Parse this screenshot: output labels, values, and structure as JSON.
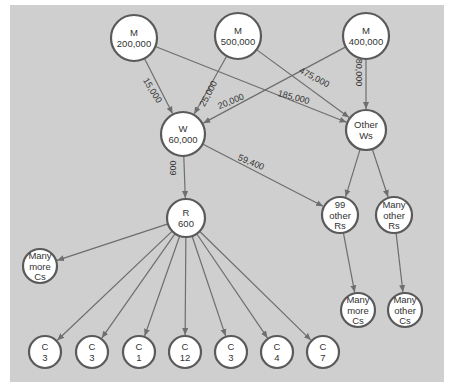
{
  "diagram": {
    "background_color": "#cfcfcf",
    "nodes": [
      {
        "id": "m1",
        "lines": [
          "M",
          "200,000"
        ],
        "x": 134,
        "y": 38,
        "r": 23
      },
      {
        "id": "m2",
        "lines": [
          "M",
          "500,000"
        ],
        "x": 238,
        "y": 36,
        "r": 23
      },
      {
        "id": "m3",
        "lines": [
          "M",
          "400,000"
        ],
        "x": 366,
        "y": 36,
        "r": 23
      },
      {
        "id": "w",
        "lines": [
          "W",
          "60,000"
        ],
        "x": 183,
        "y": 134,
        "r": 22
      },
      {
        "id": "ows",
        "lines": [
          "Other",
          "Ws"
        ],
        "x": 366,
        "y": 130,
        "r": 20
      },
      {
        "id": "r",
        "lines": [
          "R",
          "600"
        ],
        "x": 186,
        "y": 218,
        "r": 19
      },
      {
        "id": "r99",
        "lines": [
          "99",
          "other",
          "Rs"
        ],
        "x": 340,
        "y": 215,
        "r": 18
      },
      {
        "id": "mors",
        "lines": [
          "Many",
          "other",
          "Rs"
        ],
        "x": 394,
        "y": 215,
        "r": 18
      },
      {
        "id": "mcl",
        "lines": [
          "Many",
          "more",
          "Cs"
        ],
        "x": 40,
        "y": 266,
        "r": 17
      },
      {
        "id": "c1",
        "lines": [
          "C",
          "3"
        ],
        "x": 45,
        "y": 352,
        "r": 16
      },
      {
        "id": "c2",
        "lines": [
          "C",
          "3"
        ],
        "x": 92,
        "y": 352,
        "r": 16
      },
      {
        "id": "c3",
        "lines": [
          "C",
          "1"
        ],
        "x": 139,
        "y": 352,
        "r": 16
      },
      {
        "id": "c4",
        "lines": [
          "C",
          "12"
        ],
        "x": 185,
        "y": 352,
        "r": 16
      },
      {
        "id": "c5",
        "lines": [
          "C",
          "3"
        ],
        "x": 231,
        "y": 352,
        "r": 16
      },
      {
        "id": "c6",
        "lines": [
          "C",
          "4"
        ],
        "x": 277,
        "y": 352,
        "r": 16
      },
      {
        "id": "c7",
        "lines": [
          "C",
          "7"
        ],
        "x": 323,
        "y": 352,
        "r": 16
      },
      {
        "id": "mcr",
        "lines": [
          "Many",
          "more",
          "Cs"
        ],
        "x": 358,
        "y": 310,
        "r": 17
      },
      {
        "id": "moc",
        "lines": [
          "Many",
          "other",
          "Cs"
        ],
        "x": 405,
        "y": 310,
        "r": 17
      }
    ],
    "edges": [
      {
        "from": "m1",
        "to": "w",
        "label": "15,000"
      },
      {
        "from": "m2",
        "to": "w",
        "label": "25,000"
      },
      {
        "from": "m3",
        "to": "w",
        "label": "20,000"
      },
      {
        "from": "m1",
        "to": "ows",
        "label": "185,000"
      },
      {
        "from": "m2",
        "to": "ows",
        "label": "475,000"
      },
      {
        "from": "m3",
        "to": "ows",
        "label": "380,000"
      },
      {
        "from": "w",
        "to": "r",
        "label": "600"
      },
      {
        "from": "w",
        "to": "r99",
        "label": "59,400"
      },
      {
        "from": "ows",
        "to": "r99",
        "label": ""
      },
      {
        "from": "ows",
        "to": "mors",
        "label": ""
      },
      {
        "from": "r",
        "to": "mcl",
        "label": ""
      },
      {
        "from": "r",
        "to": "c1",
        "label": ""
      },
      {
        "from": "r",
        "to": "c2",
        "label": ""
      },
      {
        "from": "r",
        "to": "c3",
        "label": ""
      },
      {
        "from": "r",
        "to": "c4",
        "label": ""
      },
      {
        "from": "r",
        "to": "c5",
        "label": ""
      },
      {
        "from": "r",
        "to": "c6",
        "label": ""
      },
      {
        "from": "r",
        "to": "c7",
        "label": ""
      },
      {
        "from": "r99",
        "to": "mcr",
        "label": ""
      },
      {
        "from": "mors",
        "to": "moc",
        "label": ""
      }
    ],
    "edge_labels": [
      {
        "text": "15,000",
        "x": 150,
        "y": 92,
        "rotate": 58
      },
      {
        "text": "25,000",
        "x": 211,
        "y": 95,
        "rotate": -62
      },
      {
        "text": "20,000",
        "x": 232,
        "y": 104,
        "rotate": -22
      },
      {
        "text": "185,000",
        "x": 293,
        "y": 100,
        "rotate": 15
      },
      {
        "text": "475,000",
        "x": 313,
        "y": 80,
        "rotate": 28
      },
      {
        "text": "380,000",
        "x": 356,
        "y": 70,
        "rotate": 90
      },
      {
        "text": "600",
        "x": 176,
        "y": 168,
        "rotate": -90
      },
      {
        "text": "59,400",
        "x": 250,
        "y": 165,
        "rotate": 22
      }
    ]
  }
}
